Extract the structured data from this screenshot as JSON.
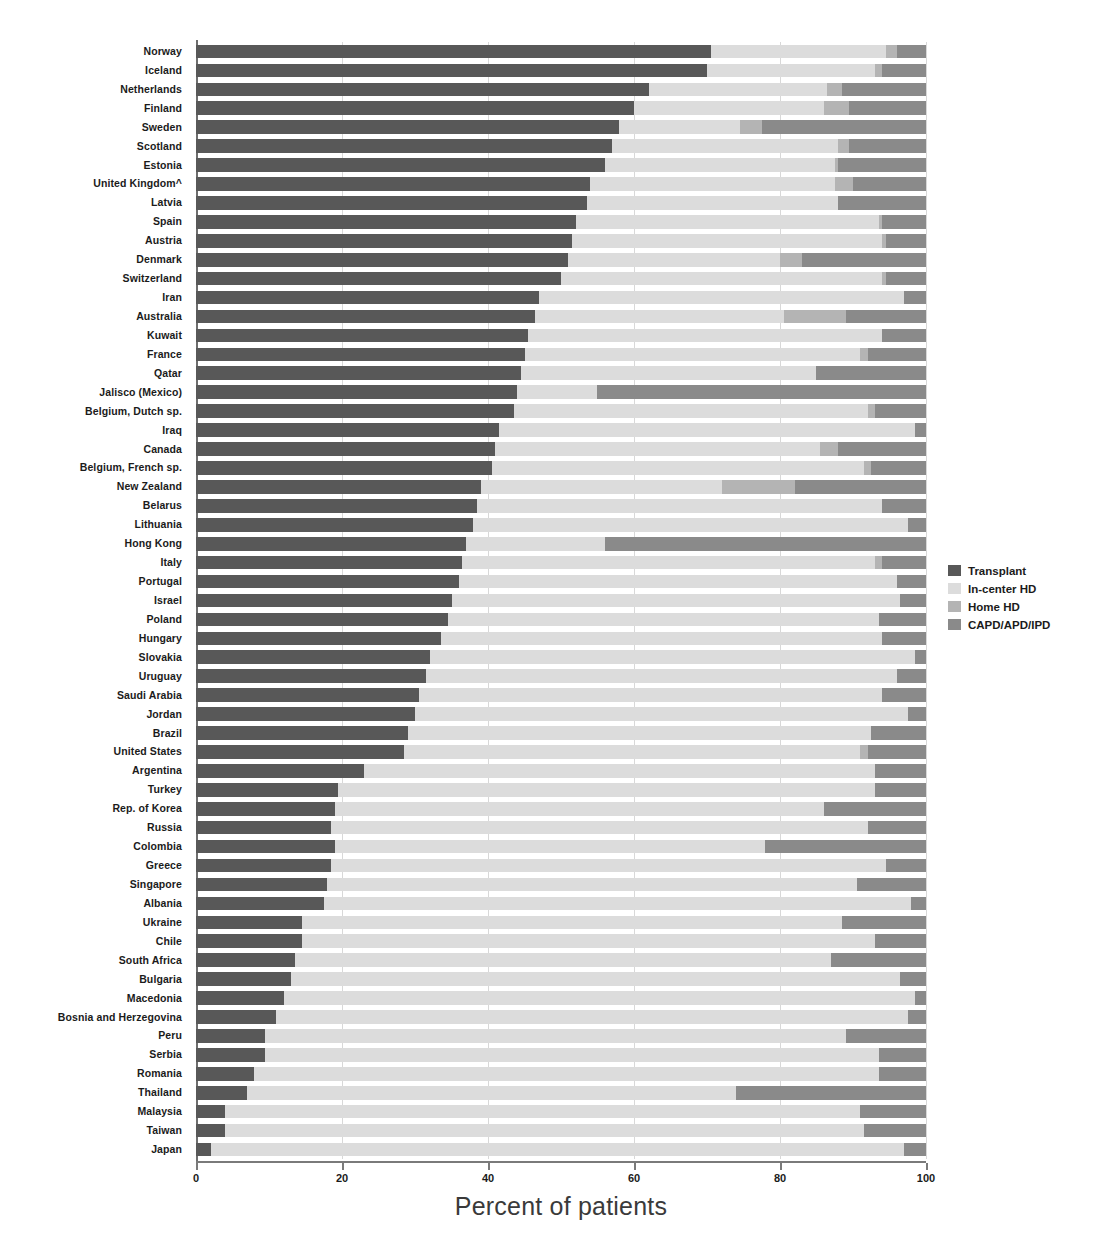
{
  "chart_data": {
    "type": "bar",
    "subtype": "stacked-horizontal-100pct",
    "title": "",
    "xlabel": "Percent of patients",
    "ylabel": "",
    "xlim": [
      0,
      100
    ],
    "xticks": [
      0,
      20,
      40,
      60,
      80,
      100
    ],
    "xticklabels": [
      "0",
      "20",
      "40",
      "60",
      "80",
      "100"
    ],
    "grid": "vertical",
    "legend_position": "right",
    "series": [
      {
        "name": "Transplant",
        "color": "#585858"
      },
      {
        "name": "In-center HD",
        "color": "#dcdcdc"
      },
      {
        "name": "Home HD",
        "color": "#b4b4b4"
      },
      {
        "name": "CAPD/APD/IPD",
        "color": "#8a8a8a"
      }
    ],
    "categories": [
      "Norway",
      "Iceland",
      "Netherlands",
      "Finland",
      "Sweden",
      "Scotland",
      "Estonia",
      "United Kingdom^",
      "Latvia",
      "Spain",
      "Austria",
      "Denmark",
      "Switzerland",
      "Iran",
      "Australia",
      "Kuwait",
      "France",
      "Qatar",
      "Jalisco (Mexico)",
      "Belgium, Dutch sp.",
      "Iraq",
      "Canada",
      "Belgium, French sp.",
      "New Zealand",
      "Belarus",
      "Lithuania",
      "Hong Kong",
      "Italy",
      "Portugal",
      "Israel",
      "Poland",
      "Hungary",
      "Slovakia",
      "Uruguay",
      "Saudi Arabia",
      "Jordan",
      "Brazil",
      "United States",
      "Argentina",
      "Turkey",
      "Rep. of Korea",
      "Russia",
      "Colombia",
      "Greece",
      "Singapore",
      "Albania",
      "Ukraine",
      "Chile",
      "South Africa",
      "Bulgaria",
      "Macedonia",
      "Bosnia and Herzegovina",
      "Peru",
      "Serbia",
      "Romania",
      "Thailand",
      "Malaysia",
      "Taiwan",
      "Japan"
    ],
    "values": [
      {
        "country": "Norway",
        "transplant": 70.5,
        "incenter_hd": 24.0,
        "home_hd": 1.5,
        "capd_apd_ipd": 4.0
      },
      {
        "country": "Iceland",
        "transplant": 70.0,
        "incenter_hd": 23.0,
        "home_hd": 1.0,
        "capd_apd_ipd": 6.0
      },
      {
        "country": "Netherlands",
        "transplant": 62.0,
        "incenter_hd": 24.5,
        "home_hd": 2.0,
        "capd_apd_ipd": 11.5
      },
      {
        "country": "Finland",
        "transplant": 60.0,
        "incenter_hd": 26.0,
        "home_hd": 3.5,
        "capd_apd_ipd": 10.5
      },
      {
        "country": "Sweden",
        "transplant": 58.0,
        "incenter_hd": 16.5,
        "home_hd": 3.0,
        "capd_apd_ipd": 22.5
      },
      {
        "country": "Scotland",
        "transplant": 57.0,
        "incenter_hd": 31.0,
        "home_hd": 1.5,
        "capd_apd_ipd": 10.5
      },
      {
        "country": "Estonia",
        "transplant": 56.0,
        "incenter_hd": 31.5,
        "home_hd": 0.5,
        "capd_apd_ipd": 12.0
      },
      {
        "country": "United Kingdom^",
        "transplant": 54.0,
        "incenter_hd": 33.5,
        "home_hd": 2.5,
        "capd_apd_ipd": 10.0
      },
      {
        "country": "Latvia",
        "transplant": 53.5,
        "incenter_hd": 34.5,
        "home_hd": 0.0,
        "capd_apd_ipd": 12.0
      },
      {
        "country": "Spain",
        "transplant": 52.0,
        "incenter_hd": 41.5,
        "home_hd": 0.5,
        "capd_apd_ipd": 6.0
      },
      {
        "country": "Austria",
        "transplant": 51.5,
        "incenter_hd": 42.5,
        "home_hd": 0.5,
        "capd_apd_ipd": 5.5
      },
      {
        "country": "Denmark",
        "transplant": 51.0,
        "incenter_hd": 29.0,
        "home_hd": 3.0,
        "capd_apd_ipd": 17.0
      },
      {
        "country": "Switzerland",
        "transplant": 50.0,
        "incenter_hd": 44.0,
        "home_hd": 0.5,
        "capd_apd_ipd": 5.5
      },
      {
        "country": "Iran",
        "transplant": 47.0,
        "incenter_hd": 50.0,
        "home_hd": 0.0,
        "capd_apd_ipd": 3.0
      },
      {
        "country": "Australia",
        "transplant": 46.5,
        "incenter_hd": 34.0,
        "home_hd": 8.5,
        "capd_apd_ipd": 11.0
      },
      {
        "country": "Kuwait",
        "transplant": 45.5,
        "incenter_hd": 48.5,
        "home_hd": 0.0,
        "capd_apd_ipd": 6.0
      },
      {
        "country": "France",
        "transplant": 45.0,
        "incenter_hd": 46.0,
        "home_hd": 1.0,
        "capd_apd_ipd": 8.0
      },
      {
        "country": "Qatar",
        "transplant": 44.5,
        "incenter_hd": 40.5,
        "home_hd": 0.0,
        "capd_apd_ipd": 15.0
      },
      {
        "country": "Jalisco (Mexico)",
        "transplant": 44.0,
        "incenter_hd": 11.0,
        "home_hd": 0.0,
        "capd_apd_ipd": 45.0
      },
      {
        "country": "Belgium, Dutch sp.",
        "transplant": 43.5,
        "incenter_hd": 48.5,
        "home_hd": 1.0,
        "capd_apd_ipd": 7.0
      },
      {
        "country": "Iraq",
        "transplant": 41.5,
        "incenter_hd": 57.0,
        "home_hd": 0.0,
        "capd_apd_ipd": 1.5
      },
      {
        "country": "Canada",
        "transplant": 41.0,
        "incenter_hd": 44.5,
        "home_hd": 2.5,
        "capd_apd_ipd": 12.0
      },
      {
        "country": "Belgium, French sp.",
        "transplant": 40.5,
        "incenter_hd": 51.0,
        "home_hd": 1.0,
        "capd_apd_ipd": 7.5
      },
      {
        "country": "New Zealand",
        "transplant": 39.0,
        "incenter_hd": 33.0,
        "home_hd": 10.0,
        "capd_apd_ipd": 18.0
      },
      {
        "country": "Belarus",
        "transplant": 38.5,
        "incenter_hd": 55.5,
        "home_hd": 0.0,
        "capd_apd_ipd": 6.0
      },
      {
        "country": "Lithuania",
        "transplant": 38.0,
        "incenter_hd": 59.5,
        "home_hd": 0.0,
        "capd_apd_ipd": 2.5
      },
      {
        "country": "Hong Kong",
        "transplant": 37.0,
        "incenter_hd": 19.0,
        "home_hd": 0.0,
        "capd_apd_ipd": 44.0
      },
      {
        "country": "Italy",
        "transplant": 36.5,
        "incenter_hd": 56.5,
        "home_hd": 1.0,
        "capd_apd_ipd": 6.0
      },
      {
        "country": "Portugal",
        "transplant": 36.0,
        "incenter_hd": 60.0,
        "home_hd": 0.0,
        "capd_apd_ipd": 4.0
      },
      {
        "country": "Israel",
        "transplant": 35.0,
        "incenter_hd": 61.5,
        "home_hd": 0.0,
        "capd_apd_ipd": 3.5
      },
      {
        "country": "Poland",
        "transplant": 34.5,
        "incenter_hd": 59.0,
        "home_hd": 0.0,
        "capd_apd_ipd": 6.5
      },
      {
        "country": "Hungary",
        "transplant": 33.5,
        "incenter_hd": 60.5,
        "home_hd": 0.0,
        "capd_apd_ipd": 6.0
      },
      {
        "country": "Slovakia",
        "transplant": 32.0,
        "incenter_hd": 66.5,
        "home_hd": 0.0,
        "capd_apd_ipd": 1.5
      },
      {
        "country": "Uruguay",
        "transplant": 31.5,
        "incenter_hd": 64.5,
        "home_hd": 0.0,
        "capd_apd_ipd": 4.0
      },
      {
        "country": "Saudi Arabia",
        "transplant": 30.5,
        "incenter_hd": 63.5,
        "home_hd": 0.0,
        "capd_apd_ipd": 6.0
      },
      {
        "country": "Jordan",
        "transplant": 30.0,
        "incenter_hd": 67.5,
        "home_hd": 0.0,
        "capd_apd_ipd": 2.5
      },
      {
        "country": "Brazil",
        "transplant": 29.0,
        "incenter_hd": 63.5,
        "home_hd": 0.0,
        "capd_apd_ipd": 7.5
      },
      {
        "country": "United States",
        "transplant": 28.5,
        "incenter_hd": 62.5,
        "home_hd": 1.0,
        "capd_apd_ipd": 8.0
      },
      {
        "country": "Argentina",
        "transplant": 23.0,
        "incenter_hd": 70.0,
        "home_hd": 0.0,
        "capd_apd_ipd": 7.0
      },
      {
        "country": "Turkey",
        "transplant": 19.5,
        "incenter_hd": 73.5,
        "home_hd": 0.0,
        "capd_apd_ipd": 7.0
      },
      {
        "country": "Rep. of Korea",
        "transplant": 19.0,
        "incenter_hd": 67.0,
        "home_hd": 0.0,
        "capd_apd_ipd": 14.0
      },
      {
        "country": "Russia",
        "transplant": 18.5,
        "incenter_hd": 73.5,
        "home_hd": 0.0,
        "capd_apd_ipd": 8.0
      },
      {
        "country": "Colombia",
        "transplant": 19.0,
        "incenter_hd": 59.0,
        "home_hd": 0.0,
        "capd_apd_ipd": 22.0
      },
      {
        "country": "Greece",
        "transplant": 18.5,
        "incenter_hd": 76.0,
        "home_hd": 0.0,
        "capd_apd_ipd": 5.5
      },
      {
        "country": "Singapore",
        "transplant": 18.0,
        "incenter_hd": 72.5,
        "home_hd": 0.0,
        "capd_apd_ipd": 9.5
      },
      {
        "country": "Albania",
        "transplant": 17.5,
        "incenter_hd": 80.5,
        "home_hd": 0.0,
        "capd_apd_ipd": 2.0
      },
      {
        "country": "Ukraine",
        "transplant": 14.5,
        "incenter_hd": 74.0,
        "home_hd": 0.0,
        "capd_apd_ipd": 11.5
      },
      {
        "country": "Chile",
        "transplant": 14.5,
        "incenter_hd": 78.5,
        "home_hd": 0.0,
        "capd_apd_ipd": 7.0
      },
      {
        "country": "South Africa",
        "transplant": 13.5,
        "incenter_hd": 73.5,
        "home_hd": 0.0,
        "capd_apd_ipd": 13.0
      },
      {
        "country": "Bulgaria",
        "transplant": 13.0,
        "incenter_hd": 83.5,
        "home_hd": 0.0,
        "capd_apd_ipd": 3.5
      },
      {
        "country": "Macedonia",
        "transplant": 12.0,
        "incenter_hd": 86.5,
        "home_hd": 0.0,
        "capd_apd_ipd": 1.5
      },
      {
        "country": "Bosnia and Herzegovina",
        "transplant": 11.0,
        "incenter_hd": 86.5,
        "home_hd": 0.0,
        "capd_apd_ipd": 2.5
      },
      {
        "country": "Peru",
        "transplant": 9.5,
        "incenter_hd": 79.5,
        "home_hd": 0.0,
        "capd_apd_ipd": 11.0
      },
      {
        "country": "Serbia",
        "transplant": 9.5,
        "incenter_hd": 84.0,
        "home_hd": 0.0,
        "capd_apd_ipd": 6.5
      },
      {
        "country": "Romania",
        "transplant": 8.0,
        "incenter_hd": 85.5,
        "home_hd": 0.0,
        "capd_apd_ipd": 6.5
      },
      {
        "country": "Thailand",
        "transplant": 7.0,
        "incenter_hd": 67.0,
        "home_hd": 0.0,
        "capd_apd_ipd": 26.0
      },
      {
        "country": "Malaysia",
        "transplant": 4.0,
        "incenter_hd": 87.0,
        "home_hd": 0.0,
        "capd_apd_ipd": 9.0
      },
      {
        "country": "Taiwan",
        "transplant": 4.0,
        "incenter_hd": 87.5,
        "home_hd": 0.0,
        "capd_apd_ipd": 8.5
      },
      {
        "country": "Japan",
        "transplant": 2.0,
        "incenter_hd": 95.0,
        "home_hd": 0.0,
        "capd_apd_ipd": 3.0
      }
    ]
  },
  "axis": {
    "x_title": "Percent of patients",
    "x_ticklabels": [
      "0",
      "20",
      "40",
      "60",
      "80",
      "100"
    ]
  },
  "legend": {
    "items": [
      {
        "label": "Transplant",
        "color": "#585858"
      },
      {
        "label": "In-center HD",
        "color": "#dcdcdc"
      },
      {
        "label": "Home HD",
        "color": "#b4b4b4"
      },
      {
        "label": "CAPD/APD/IPD",
        "color": "#8a8a8a"
      }
    ]
  }
}
